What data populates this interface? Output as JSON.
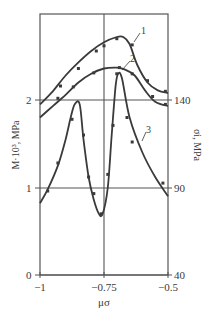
{
  "chart_data": {
    "type": "line",
    "title": "",
    "xlabel": "μσ",
    "ylabel_left": "M·10³, MPa",
    "ylabel_right": "σi, MPa",
    "xlim": [
      -1,
      -0.5
    ],
    "ylim_left": [
      0,
      2.97
    ],
    "ylim_right": [
      40,
      188
    ],
    "grid": {
      "x": [
        -0.75
      ],
      "y": [
        1,
        2
      ]
    },
    "x_ticks": [
      {
        "value": -1,
        "label": "−1"
      },
      {
        "value": -0.75,
        "label": "−0.75"
      },
      {
        "value": -0.5,
        "label": "−0.5"
      }
    ],
    "y_ticks_left": [
      {
        "value": 0,
        "label": "0"
      },
      {
        "value": 1,
        "label": "1"
      },
      {
        "value": 2,
        "label": "2"
      }
    ],
    "y_ticks_right": [
      {
        "value": 40,
        "label": "40"
      },
      {
        "value": 90,
        "label": "90"
      },
      {
        "value": 140,
        "label": "140"
      }
    ],
    "series": [
      {
        "name": "1",
        "curve": [
          [
            -1.0,
            1.95
          ],
          [
            -0.95,
            2.1
          ],
          [
            -0.9,
            2.28
          ],
          [
            -0.85,
            2.43
          ],
          [
            -0.8,
            2.56
          ],
          [
            -0.75,
            2.66
          ],
          [
            -0.7,
            2.72
          ],
          [
            -0.675,
            2.72
          ],
          [
            -0.65,
            2.64
          ],
          [
            -0.62,
            2.4
          ],
          [
            -0.58,
            2.2
          ],
          [
            -0.54,
            2.11
          ],
          [
            -0.5,
            2.08
          ]
        ],
        "points": [
          [
            -0.92,
            2.16
          ],
          [
            -0.85,
            2.36
          ],
          [
            -0.78,
            2.56
          ],
          [
            -0.75,
            2.62
          ],
          [
            -0.7,
            2.7
          ],
          [
            -0.64,
            2.63
          ],
          [
            -0.58,
            2.22
          ],
          [
            -0.51,
            2.1
          ]
        ]
      },
      {
        "name": "2",
        "curve": [
          [
            -1.0,
            1.8
          ],
          [
            -0.95,
            1.93
          ],
          [
            -0.9,
            2.06
          ],
          [
            -0.85,
            2.2
          ],
          [
            -0.8,
            2.3
          ],
          [
            -0.75,
            2.36
          ],
          [
            -0.7,
            2.37
          ],
          [
            -0.67,
            2.35
          ],
          [
            -0.63,
            2.28
          ],
          [
            -0.59,
            2.11
          ],
          [
            -0.55,
            1.98
          ],
          [
            -0.5,
            1.93
          ]
        ],
        "points": [
          [
            -0.93,
            2.02
          ],
          [
            -0.87,
            2.15
          ],
          [
            -0.79,
            2.31
          ],
          [
            -0.69,
            2.37
          ],
          [
            -0.64,
            2.3
          ],
          [
            -0.56,
            2.04
          ],
          [
            -0.51,
            1.95
          ]
        ]
      },
      {
        "name": "3",
        "curve": [
          [
            -1.0,
            0.82
          ],
          [
            -0.97,
            0.98
          ],
          [
            -0.93,
            1.25
          ],
          [
            -0.9,
            1.55
          ],
          [
            -0.88,
            1.8
          ],
          [
            -0.865,
            1.95
          ],
          [
            -0.845,
            1.95
          ],
          [
            -0.83,
            1.55
          ],
          [
            -0.81,
            1.12
          ],
          [
            -0.79,
            0.86
          ],
          [
            -0.77,
            0.7
          ],
          [
            -0.755,
            0.7
          ],
          [
            -0.735,
            1.0
          ],
          [
            -0.72,
            1.6
          ],
          [
            -0.705,
            2.15
          ],
          [
            -0.695,
            2.3
          ],
          [
            -0.68,
            2.25
          ],
          [
            -0.65,
            1.8
          ],
          [
            -0.6,
            1.4
          ],
          [
            -0.55,
            1.12
          ],
          [
            -0.5,
            0.9
          ]
        ],
        "points": [
          [
            -0.97,
            0.96
          ],
          [
            -0.93,
            1.28
          ],
          [
            -0.875,
            1.78
          ],
          [
            -0.83,
            1.6
          ],
          [
            -0.81,
            1.12
          ],
          [
            -0.79,
            0.93
          ],
          [
            -0.76,
            0.7
          ],
          [
            -0.735,
            1.15
          ],
          [
            -0.715,
            1.71
          ],
          [
            -0.7,
            2.3
          ],
          [
            -0.66,
            1.8
          ],
          [
            -0.64,
            1.52
          ],
          [
            -0.52,
            1.05
          ]
        ]
      }
    ],
    "annotations": [
      {
        "text": "1",
        "x": -0.66,
        "y": 2.85
      },
      {
        "text": "2",
        "x": -0.67,
        "y": 2.52
      },
      {
        "text": "3",
        "x": -0.62,
        "y": 1.35
      }
    ]
  },
  "labels": {
    "x_axis": "μσ",
    "y_left": "M·10³, MPa",
    "y_right": "σi, MPa",
    "curve1": "1",
    "curve2": "2",
    "curve3": "3",
    "xt0": "−1",
    "xt1": "−0.75",
    "xt2": "−0.5",
    "yl0": "0",
    "yl1": "1",
    "yl2": "2",
    "yr0": "40",
    "yr1": "90",
    "yr2": "140"
  }
}
